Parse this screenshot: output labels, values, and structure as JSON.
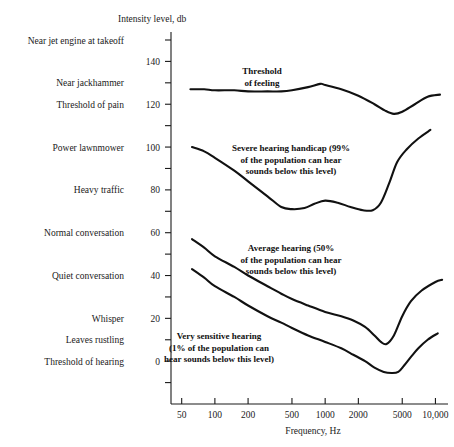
{
  "chart_data": {
    "type": "line",
    "title": "",
    "xlabel": "Frequency, Hz",
    "ylabel": "Intensity level, db",
    "xscale": "log",
    "xlim": [
      40,
      13000
    ],
    "ylim": [
      -20,
      150
    ],
    "grid": false,
    "legend": "annotations-inline",
    "xticks": [
      {
        "value": 50,
        "label": "50"
      },
      {
        "value": 100,
        "label": "100"
      },
      {
        "value": 200,
        "label": "200"
      },
      {
        "value": 500,
        "label": "500"
      },
      {
        "value": 1000,
        "label": "1000"
      },
      {
        "value": 2000,
        "label": "2000"
      },
      {
        "value": 5000,
        "label": "5000"
      },
      {
        "value": 10000,
        "label": "10,000"
      }
    ],
    "yticks": [
      {
        "value": 150,
        "label": ""
      },
      {
        "value": 140,
        "label": "140"
      },
      {
        "value": 130,
        "label": ""
      },
      {
        "value": 120,
        "label": "120"
      },
      {
        "value": 110,
        "label": ""
      },
      {
        "value": 100,
        "label": "100"
      },
      {
        "value": 90,
        "label": ""
      },
      {
        "value": 80,
        "label": "80"
      },
      {
        "value": 70,
        "label": ""
      },
      {
        "value": 60,
        "label": "60"
      },
      {
        "value": 50,
        "label": ""
      },
      {
        "value": 40,
        "label": "40"
      },
      {
        "value": 30,
        "label": ""
      },
      {
        "value": 20,
        "label": "20"
      },
      {
        "value": 10,
        "label": ""
      },
      {
        "value": 0,
        "label": "0"
      },
      {
        "value": -10,
        "label": ""
      }
    ],
    "y_reference_labels": [
      {
        "value": 150,
        "label": "Near jet engine at takeoff"
      },
      {
        "value": 130,
        "label": "Near jackhammer"
      },
      {
        "value": 120,
        "label": "Threshold of pain"
      },
      {
        "value": 100,
        "label": "Power lawnmower"
      },
      {
        "value": 80,
        "label": "Heavy traffic"
      },
      {
        "value": 60,
        "label": "Normal conversation"
      },
      {
        "value": 40,
        "label": "Quiet conversation"
      },
      {
        "value": 20,
        "label": "Whisper"
      },
      {
        "value": 10,
        "label": "Leaves rustling"
      },
      {
        "value": 0,
        "label": "Threshold of hearing"
      }
    ],
    "series": [
      {
        "name": "Threshold of feeling",
        "points": [
          [
            60,
            127
          ],
          [
            80,
            127
          ],
          [
            100,
            126.5
          ],
          [
            150,
            126.5
          ],
          [
            200,
            126
          ],
          [
            300,
            126
          ],
          [
            400,
            126
          ],
          [
            500,
            126.5
          ],
          [
            700,
            128
          ],
          [
            900,
            129.5
          ],
          [
            1000,
            129
          ],
          [
            1400,
            127
          ],
          [
            2000,
            124
          ],
          [
            2800,
            120
          ],
          [
            3500,
            117
          ],
          [
            4200,
            115.5
          ],
          [
            5000,
            116.5
          ],
          [
            6500,
            120
          ],
          [
            8500,
            123.5
          ],
          [
            11000,
            124.5
          ]
        ]
      },
      {
        "name": "Severe hearing handicap (99%)",
        "points": [
          [
            62,
            100
          ],
          [
            80,
            98
          ],
          [
            100,
            95
          ],
          [
            150,
            89
          ],
          [
            200,
            84
          ],
          [
            300,
            77
          ],
          [
            400,
            72
          ],
          [
            500,
            71
          ],
          [
            650,
            71.5
          ],
          [
            800,
            73.5
          ],
          [
            1000,
            75
          ],
          [
            1300,
            74
          ],
          [
            1700,
            72
          ],
          [
            2200,
            70.5
          ],
          [
            2700,
            70.5
          ],
          [
            3200,
            74
          ],
          [
            3800,
            83
          ],
          [
            4500,
            93
          ],
          [
            5500,
            99
          ],
          [
            7000,
            104
          ],
          [
            9000,
            108
          ]
        ]
      },
      {
        "name": "Average hearing (50%)",
        "points": [
          [
            62,
            57
          ],
          [
            80,
            53
          ],
          [
            100,
            49
          ],
          [
            150,
            44
          ],
          [
            200,
            40
          ],
          [
            300,
            35
          ],
          [
            400,
            31.5
          ],
          [
            500,
            29
          ],
          [
            700,
            26
          ],
          [
            1000,
            23
          ],
          [
            1400,
            21
          ],
          [
            1800,
            19
          ],
          [
            2300,
            16
          ],
          [
            2800,
            12
          ],
          [
            3200,
            9
          ],
          [
            3600,
            8
          ],
          [
            4200,
            12
          ],
          [
            5000,
            21
          ],
          [
            6000,
            28
          ],
          [
            7500,
            33
          ],
          [
            10000,
            37
          ],
          [
            11500,
            38
          ]
        ]
      },
      {
        "name": "Very sensitive hearing (1%)",
        "points": [
          [
            62,
            43
          ],
          [
            80,
            39
          ],
          [
            100,
            35
          ],
          [
            150,
            30
          ],
          [
            200,
            26
          ],
          [
            300,
            21
          ],
          [
            400,
            18
          ],
          [
            500,
            15.5
          ],
          [
            700,
            12
          ],
          [
            1000,
            9
          ],
          [
            1400,
            6
          ],
          [
            1800,
            3
          ],
          [
            2300,
            0
          ],
          [
            2800,
            -3
          ],
          [
            3400,
            -5
          ],
          [
            4000,
            -5.5
          ],
          [
            4600,
            -5
          ],
          [
            5200,
            -2
          ],
          [
            6000,
            2
          ],
          [
            7000,
            6
          ],
          [
            8500,
            10
          ],
          [
            10500,
            13
          ]
        ]
      }
    ],
    "annotations": [
      {
        "name": "threshold-of-feeling",
        "lines": [
          "Threshold",
          "of feeling"
        ],
        "x": 262,
        "y": 74,
        "align": "middle"
      },
      {
        "name": "severe-hearing-handicap",
        "lines": [
          "Severe hearing handicap (99%",
          "of the population can hear",
          "sounds below this level)"
        ],
        "x": 291,
        "y": 151,
        "align": "middle"
      },
      {
        "name": "average-hearing",
        "lines": [
          "Average hearing (50%",
          "of the population can hear",
          "sounds below this level)"
        ],
        "x": 291,
        "y": 251,
        "align": "middle"
      },
      {
        "name": "very-sensitive-hearing",
        "lines": [
          "Very sensitive hearing",
          "(1% of the population can",
          "hear sounds below this level)"
        ],
        "x": 219,
        "y": 339,
        "align": "middle"
      }
    ]
  }
}
